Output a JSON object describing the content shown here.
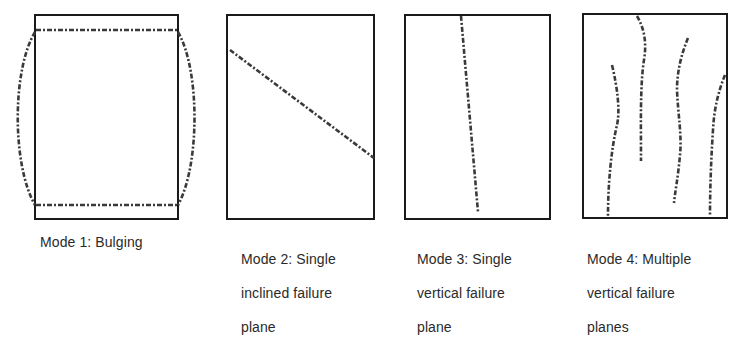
{
  "figure": {
    "panels": [
      {
        "id": "mode-1",
        "caption": "Mode 1: Bulging",
        "caption_lines": [
          "Mode 1: Bulging"
        ],
        "frame": {
          "x": 35,
          "y": 15,
          "width": 143,
          "height": 204
        },
        "features": [
          "top dashed line",
          "bottom dashed line",
          "left bulge curve",
          "right bulge curve"
        ]
      },
      {
        "id": "mode-2",
        "caption": "Mode 2: Single inclined failure plane",
        "caption_lines": [
          "Mode 2: Single",
          "inclined failure",
          "plane"
        ],
        "frame": {
          "x": 227,
          "y": 15,
          "width": 147,
          "height": 204
        },
        "features": [
          "single inclined dashed failure line"
        ]
      },
      {
        "id": "mode-3",
        "caption": "Mode 3: Single vertical failure plane",
        "caption_lines": [
          "Mode 3: Single",
          "vertical failure",
          "plane"
        ],
        "frame": {
          "x": 405,
          "y": 15,
          "width": 145,
          "height": 204
        },
        "features": [
          "single near-vertical dashed failure line"
        ]
      },
      {
        "id": "mode-4",
        "caption": "Mode 4: Multiple vertical failure planes",
        "caption_lines": [
          "Mode 4: Multiple",
          "vertical failure",
          "planes"
        ],
        "frame": {
          "x": 583,
          "y": 14,
          "width": 144,
          "height": 204
        },
        "features": [
          "four wavy near-vertical dashed failure lines"
        ]
      }
    ],
    "colors": {
      "frame": "#1a1a1a",
      "crack": "#3a3a3a",
      "text": "#2a2a2a",
      "background": "#ffffff"
    }
  }
}
